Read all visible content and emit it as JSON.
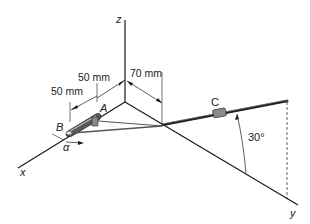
{
  "diagram": {
    "type": "3d-mechanism",
    "axes": {
      "x": "x",
      "y": "y",
      "z": "z"
    },
    "points": {
      "A": "A",
      "B": "B",
      "C": "C"
    },
    "dimensions": {
      "dim1": "50 mm",
      "dim2": "50 mm",
      "dim3": "70 mm"
    },
    "angles": {
      "alpha": "α",
      "theta": "30°"
    },
    "colors": {
      "line": "#1a1a1a",
      "crank": "#555555",
      "rod": "#444444"
    }
  }
}
